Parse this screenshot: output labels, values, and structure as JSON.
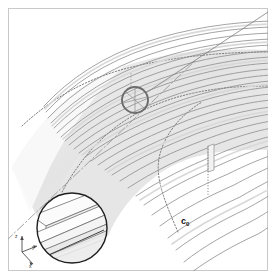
{
  "figure": {
    "type": "engineering-line-drawing",
    "canvas": {
      "width": 276,
      "height": 279,
      "background": "#ffffff"
    },
    "frame": {
      "present": true,
      "color": "#c9c9c9",
      "inset": 7
    }
  },
  "labels": {
    "c0": {
      "base": "c",
      "subscript": "0",
      "x": 181,
      "y": 216,
      "bold": true
    }
  },
  "axes_triad": {
    "origin": {
      "x": 22,
      "y": 252
    },
    "items": [
      {
        "name": "z",
        "label": "z",
        "dx": 0,
        "dy": -16
      },
      {
        "name": "y",
        "label": "y",
        "dx": 15,
        "dy": -6
      },
      {
        "name": "x",
        "label": "x",
        "dx": 11,
        "dy": 12
      }
    ]
  },
  "detail_callout": {
    "circle": {
      "cx": 135,
      "cy": 100,
      "r": 13,
      "stroke": "#6b6b6b",
      "stroke_width": 1.8
    },
    "leader": {
      "x1": 147,
      "y1": 93,
      "x2": 268,
      "y2": 12,
      "stroke": "#777777"
    }
  },
  "detail_inset": {
    "circle": {
      "cx": 72,
      "cy": 228,
      "r": 36,
      "stroke": "#1f1f1f",
      "stroke_width": 1.4
    },
    "content": "stringer-cross-section"
  },
  "shell": {
    "band": {
      "fill": "#e6e6e6",
      "stroke": "#bdbdbd"
    },
    "stringer_count": 26,
    "stringer_stroke": "#8d8d8d",
    "dashed_arcs": 2,
    "dash_dot_centerline": true
  },
  "colors": {
    "line": "#8d8d8d",
    "dark_line": "#4a4a4a",
    "band_fill": "#e6e6e6",
    "band_fill_light": "#efefef",
    "frame": "#c9c9c9",
    "text": "#111111"
  }
}
